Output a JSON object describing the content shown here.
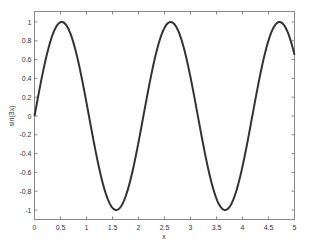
{
  "chart_data": {
    "type": "line",
    "title": "",
    "xlabel": "x",
    "ylabel": "sin(3x)",
    "xlim": [
      0,
      5
    ],
    "ylim": [
      -1.1,
      1.1
    ],
    "grid": false,
    "legend": null,
    "xticks": [
      0,
      0.5,
      1,
      1.5,
      2,
      2.5,
      3,
      3.5,
      4,
      4.5,
      5
    ],
    "xtick_labels": [
      "0",
      "0.5",
      "1",
      "1.5",
      "2",
      "2.5",
      "3",
      "3.5",
      "4",
      "4.5",
      "5"
    ],
    "yticks": [
      1,
      0.8,
      0.6,
      0.4,
      0.2,
      0,
      -0.2,
      -0.4,
      -0.6,
      -0.8,
      -1
    ],
    "ytick_labels": [
      "1",
      "0.8",
      "0.6",
      "0.4",
      "0.2",
      "0",
      "-0.2",
      "-0.4",
      "-0.6",
      "-0.8",
      "-1"
    ],
    "series": [
      {
        "name": "sin(3x)",
        "function": "sin(3x)",
        "color": "#333333",
        "x": [
          0,
          0.25,
          0.5236,
          0.75,
          1.0,
          1.25,
          1.5708,
          1.75,
          2.0,
          2.25,
          2.618,
          2.75,
          3.0,
          3.25,
          3.6652,
          3.75,
          4.0,
          4.25,
          4.7124,
          5.0
        ],
        "values": [
          0,
          0.68,
          1.0,
          0.78,
          0.14,
          -0.57,
          -1.0,
          -0.86,
          -0.28,
          0.45,
          1.0,
          0.92,
          0.41,
          -0.32,
          -1.0,
          -0.98,
          -0.54,
          0.19,
          1.0,
          0.65
        ]
      }
    ]
  }
}
